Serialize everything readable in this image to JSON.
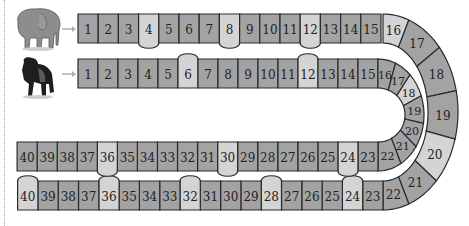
{
  "players": [
    {
      "name": "elephant",
      "icon": "elephant-icon",
      "track": "outer"
    },
    {
      "name": "gorilla",
      "icon": "gorilla-icon",
      "track": "inner"
    }
  ],
  "colors": {
    "dark_cell": "#a3a3a3",
    "light_cell": "#d4d4d4",
    "border": "#2a2a2a",
    "arrow": "#b0b0b0"
  },
  "outer_track": {
    "top_row": [
      {
        "n": "1",
        "shade": "dark"
      },
      {
        "n": "2",
        "shade": "dark"
      },
      {
        "n": "3",
        "shade": "dark"
      },
      {
        "n": "4",
        "shade": "light",
        "bump": "down"
      },
      {
        "n": "5",
        "shade": "dark"
      },
      {
        "n": "6",
        "shade": "dark"
      },
      {
        "n": "7",
        "shade": "dark"
      },
      {
        "n": "8",
        "shade": "light",
        "bump": "down"
      },
      {
        "n": "9",
        "shade": "dark"
      },
      {
        "n": "10",
        "shade": "dark"
      },
      {
        "n": "11",
        "shade": "dark"
      },
      {
        "n": "12",
        "shade": "light",
        "bump": "down"
      },
      {
        "n": "13",
        "shade": "dark"
      },
      {
        "n": "14",
        "shade": "dark"
      },
      {
        "n": "15",
        "shade": "dark"
      }
    ],
    "curve": [
      {
        "n": "16",
        "shade": "light"
      },
      {
        "n": "17",
        "shade": "dark"
      },
      {
        "n": "18",
        "shade": "dark"
      },
      {
        "n": "19",
        "shade": "dark"
      },
      {
        "n": "20",
        "shade": "light"
      },
      {
        "n": "21",
        "shade": "dark"
      },
      {
        "n": "22",
        "shade": "dark"
      }
    ],
    "bottom_row": [
      {
        "n": "23",
        "shade": "dark"
      },
      {
        "n": "24",
        "shade": "light",
        "bump": "up"
      },
      {
        "n": "25",
        "shade": "dark"
      },
      {
        "n": "26",
        "shade": "dark"
      },
      {
        "n": "27",
        "shade": "dark"
      },
      {
        "n": "28",
        "shade": "light",
        "bump": "up"
      },
      {
        "n": "29",
        "shade": "dark"
      },
      {
        "n": "30",
        "shade": "dark"
      },
      {
        "n": "31",
        "shade": "dark"
      },
      {
        "n": "32",
        "shade": "light",
        "bump": "up"
      },
      {
        "n": "33",
        "shade": "dark"
      },
      {
        "n": "34",
        "shade": "dark"
      },
      {
        "n": "35",
        "shade": "dark"
      },
      {
        "n": "36",
        "shade": "light",
        "bump": "up"
      },
      {
        "n": "37",
        "shade": "dark"
      },
      {
        "n": "38",
        "shade": "dark"
      },
      {
        "n": "39",
        "shade": "dark"
      },
      {
        "n": "40",
        "shade": "light",
        "bump": "up"
      }
    ]
  },
  "inner_track": {
    "top_row": [
      {
        "n": "1",
        "shade": "dark"
      },
      {
        "n": "2",
        "shade": "dark"
      },
      {
        "n": "3",
        "shade": "dark"
      },
      {
        "n": "4",
        "shade": "dark"
      },
      {
        "n": "5",
        "shade": "dark"
      },
      {
        "n": "6",
        "shade": "light",
        "bump": "up"
      },
      {
        "n": "7",
        "shade": "dark"
      },
      {
        "n": "8",
        "shade": "dark"
      },
      {
        "n": "9",
        "shade": "dark"
      },
      {
        "n": "10",
        "shade": "dark"
      },
      {
        "n": "11",
        "shade": "dark"
      },
      {
        "n": "12",
        "shade": "light",
        "bump": "up"
      },
      {
        "n": "13",
        "shade": "dark"
      },
      {
        "n": "14",
        "shade": "dark"
      },
      {
        "n": "15",
        "shade": "dark"
      }
    ],
    "curve": [
      {
        "n": "16",
        "shade": "dark"
      },
      {
        "n": "17",
        "shade": "dark"
      },
      {
        "n": "18",
        "shade": "light"
      },
      {
        "n": "19",
        "shade": "dark"
      },
      {
        "n": "20",
        "shade": "dark"
      },
      {
        "n": "21",
        "shade": "dark"
      },
      {
        "n": "22",
        "shade": "dark"
      }
    ],
    "bottom_row": [
      {
        "n": "23",
        "shade": "dark"
      },
      {
        "n": "24",
        "shade": "light",
        "bump": "down"
      },
      {
        "n": "25",
        "shade": "dark"
      },
      {
        "n": "26",
        "shade": "dark"
      },
      {
        "n": "27",
        "shade": "dark"
      },
      {
        "n": "28",
        "shade": "dark"
      },
      {
        "n": "29",
        "shade": "dark"
      },
      {
        "n": "30",
        "shade": "light",
        "bump": "down"
      },
      {
        "n": "31",
        "shade": "dark"
      },
      {
        "n": "32",
        "shade": "dark"
      },
      {
        "n": "33",
        "shade": "dark"
      },
      {
        "n": "34",
        "shade": "dark"
      },
      {
        "n": "35",
        "shade": "dark"
      },
      {
        "n": "36",
        "shade": "light",
        "bump": "down"
      },
      {
        "n": "37",
        "shade": "dark"
      },
      {
        "n": "38",
        "shade": "dark"
      },
      {
        "n": "39",
        "shade": "dark"
      },
      {
        "n": "40",
        "shade": "dark"
      }
    ]
  }
}
